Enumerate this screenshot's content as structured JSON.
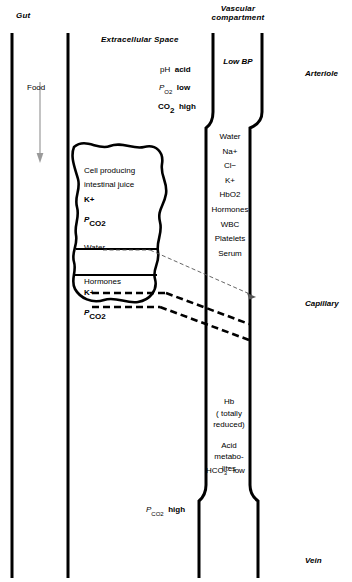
{
  "headers": {
    "gut": "Gut",
    "extracellular": "Extracellular Space",
    "vascular_line1": "Vascular",
    "vascular_line2": "compartment"
  },
  "side_labels": {
    "arteriole": "Arteriole",
    "capillary": "Capillary",
    "vein": "Vein"
  },
  "gut": {
    "food": "Food"
  },
  "extracellular": {
    "ph": "pH",
    "ph_state": "acid",
    "po2": "P",
    "po2_sub": "O2",
    "po2_state": "low",
    "co2": "CO",
    "co2_sub": "2",
    "co2_state": "high",
    "pco2_bottom": "P",
    "pco2_bottom_sub": "CO2",
    "pco2_bottom_state": "high"
  },
  "cell": {
    "name_line1": "Cell producing",
    "name_line2": "intestinal juice",
    "k": "K+",
    "pco2": "P",
    "pco2_sub": "CO2",
    "water": "Water",
    "hormones": "Hormones",
    "k2": "K+",
    "pco2_2": "P",
    "pco2_2_sub": "CO2"
  },
  "vessel": {
    "low_bp": "Low BP",
    "arterial_contents": [
      "Water",
      "Na+",
      "Cl−",
      "K+",
      "HbO2",
      "Hormones",
      "WBC",
      "Platelets",
      "Serum"
    ],
    "venous": {
      "hb_line1": "Hb",
      "hb_line2": "( totally",
      "hb_line3": "reduced)",
      "acid_line1": "Acid",
      "acid_line2": "metabo-",
      "acid_line3": "lites",
      "hco3": "HCO",
      "hco3_sub": "3",
      "hco3_sup": "−",
      "hco3_state": "low"
    }
  },
  "colors": {
    "ink": "#000000",
    "food_arrow": "#9a9a9a",
    "thin_arrow": "#555555"
  }
}
